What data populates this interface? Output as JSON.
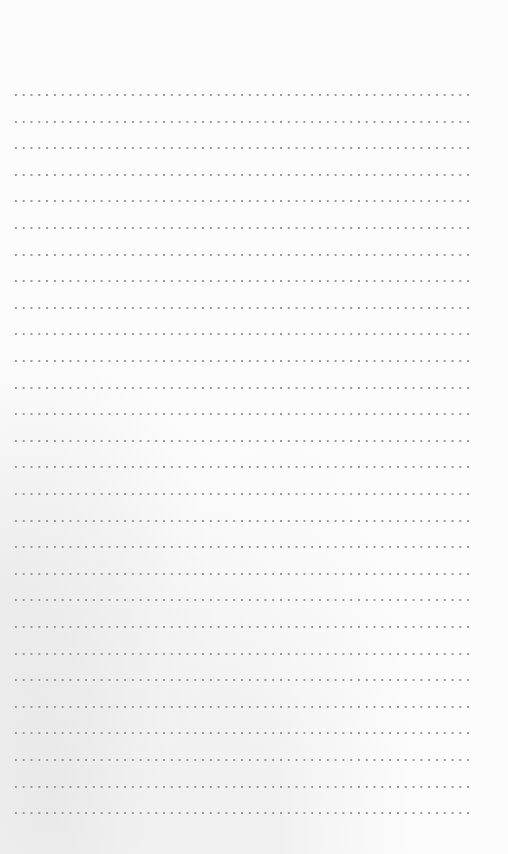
{
  "page": {
    "type": "dotted-lined-paper",
    "background_color": "#fcfcfc",
    "dot_color": "#9a9a9a",
    "line_count": 28,
    "first_line_y": 95,
    "line_spacing": 26.6,
    "line_left": 12,
    "line_width": 462,
    "dot_spacing": 7.8
  }
}
